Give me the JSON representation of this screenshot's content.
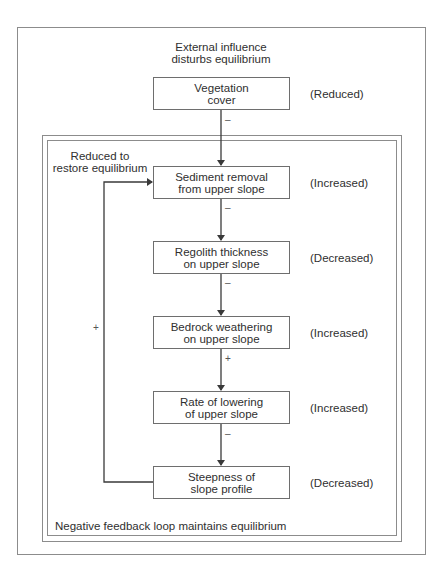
{
  "diagram": {
    "heading": {
      "line1": "External influence",
      "line2": "disturbs equilibrium"
    },
    "loop_note": {
      "line1": "Reduced to",
      "line2": "restore equilibrium"
    },
    "footer_note": "Negative feedback loop maintains equilibrium",
    "nodes": [
      {
        "line1": "Vegetation",
        "line2": "cover",
        "state": "(Reduced)"
      },
      {
        "line1": "Sediment removal",
        "line2": "from upper slope",
        "state": "(Increased)"
      },
      {
        "line1": "Regolith thickness",
        "line2": "on upper slope",
        "state": "(Decreased)"
      },
      {
        "line1": "Bedrock weathering",
        "line2": "on upper slope",
        "state": "(Increased)"
      },
      {
        "line1": "Rate of lowering",
        "line2": "of upper slope",
        "state": "(Increased)"
      },
      {
        "line1": "Steepness of",
        "line2": "slope profile",
        "state": "(Decreased)"
      }
    ],
    "edges": [
      {
        "from": 0,
        "to": 1,
        "sign": "–"
      },
      {
        "from": 1,
        "to": 2,
        "sign": "–"
      },
      {
        "from": 2,
        "to": 3,
        "sign": "–"
      },
      {
        "from": 3,
        "to": 4,
        "sign": "+"
      },
      {
        "from": 4,
        "to": 5,
        "sign": "–"
      },
      {
        "from": 5,
        "to": 1,
        "sign": "+",
        "type": "feedback"
      }
    ],
    "colors": {
      "line": "#3a3a3a",
      "frame": "#8c8c8c",
      "text": "#2f2f2f"
    }
  }
}
